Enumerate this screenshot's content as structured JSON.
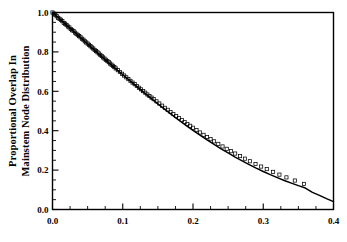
{
  "chart_data": {
    "type": "scatter",
    "title": "",
    "subtitle": "",
    "xlabel": "",
    "ylabel_line1": "Proportional Overlap In",
    "ylabel_line2": "Mainstem Node Distribution",
    "xlim": [
      0.0,
      0.4
    ],
    "ylim": [
      0.0,
      1.0
    ],
    "grid": false,
    "legend": null,
    "legend_position": "none",
    "x_ticks": [
      0.0,
      0.1,
      0.2,
      0.3,
      0.4
    ],
    "x_tick_labels": [
      "0.0",
      "0.1",
      "0.2",
      "0.3",
      "0.4"
    ],
    "x_minor_tick_step": 0.025,
    "y_ticks": [
      0.0,
      0.2,
      0.4,
      0.6,
      0.8,
      1.0
    ],
    "y_tick_labels": [
      "0.0",
      "0.2",
      "0.4",
      "0.6",
      "0.8",
      "1.0"
    ],
    "y_minor_tick_step": 0.05,
    "series": [
      {
        "name": "fitted curve",
        "type": "line",
        "marker": "none",
        "color": "#000000",
        "x": [
          0.0,
          0.01,
          0.02,
          0.03,
          0.04,
          0.05,
          0.06,
          0.07,
          0.08,
          0.09,
          0.1,
          0.11,
          0.12,
          0.13,
          0.14,
          0.15,
          0.16,
          0.17,
          0.18,
          0.19,
          0.2,
          0.21,
          0.22,
          0.23,
          0.24,
          0.25,
          0.26,
          0.27,
          0.28,
          0.29,
          0.3,
          0.31,
          0.32,
          0.33,
          0.34,
          0.35,
          0.36,
          0.37,
          0.38,
          0.39,
          0.4
        ],
        "y": [
          1.0,
          0.968,
          0.936,
          0.904,
          0.872,
          0.84,
          0.808,
          0.776,
          0.745,
          0.714,
          0.684,
          0.654,
          0.624,
          0.594,
          0.565,
          0.536,
          0.508,
          0.48,
          0.453,
          0.427,
          0.402,
          0.377,
          0.353,
          0.33,
          0.308,
          0.287,
          0.266,
          0.247,
          0.228,
          0.21,
          0.193,
          0.177,
          0.162,
          0.147,
          0.134,
          0.121,
          0.109,
          0.087,
          0.072,
          0.055,
          0.04
        ]
      },
      {
        "name": "observed data",
        "type": "scatter",
        "marker": "open-square",
        "color": "#000000",
        "x": [
          0.0,
          0.002,
          0.004,
          0.006,
          0.008,
          0.01,
          0.012,
          0.014,
          0.016,
          0.018,
          0.02,
          0.022,
          0.024,
          0.026,
          0.028,
          0.03,
          0.032,
          0.034,
          0.036,
          0.038,
          0.04,
          0.042,
          0.044,
          0.046,
          0.048,
          0.05,
          0.052,
          0.054,
          0.056,
          0.058,
          0.06,
          0.062,
          0.064,
          0.066,
          0.068,
          0.07,
          0.072,
          0.074,
          0.076,
          0.078,
          0.08,
          0.082,
          0.084,
          0.086,
          0.088,
          0.09,
          0.093,
          0.096,
          0.099,
          0.102,
          0.105,
          0.108,
          0.111,
          0.114,
          0.117,
          0.12,
          0.123,
          0.126,
          0.129,
          0.132,
          0.135,
          0.138,
          0.141,
          0.144,
          0.148,
          0.152,
          0.156,
          0.16,
          0.164,
          0.168,
          0.172,
          0.176,
          0.18,
          0.184,
          0.188,
          0.192,
          0.196,
          0.2,
          0.205,
          0.21,
          0.215,
          0.22,
          0.225,
          0.23,
          0.236,
          0.242,
          0.248,
          0.254,
          0.26,
          0.267,
          0.274,
          0.281,
          0.289,
          0.297,
          0.305,
          0.314,
          0.323,
          0.333,
          0.345,
          0.358
        ],
        "y": [
          1.0,
          0.994,
          0.988,
          0.981,
          0.973,
          0.968,
          0.963,
          0.956,
          0.947,
          0.943,
          0.936,
          0.929,
          0.924,
          0.916,
          0.91,
          0.906,
          0.898,
          0.892,
          0.886,
          0.88,
          0.874,
          0.867,
          0.862,
          0.854,
          0.848,
          0.842,
          0.836,
          0.829,
          0.823,
          0.817,
          0.81,
          0.804,
          0.798,
          0.792,
          0.785,
          0.779,
          0.772,
          0.766,
          0.76,
          0.754,
          0.748,
          0.741,
          0.735,
          0.729,
          0.723,
          0.716,
          0.707,
          0.698,
          0.689,
          0.68,
          0.671,
          0.662,
          0.653,
          0.644,
          0.636,
          0.627,
          0.618,
          0.61,
          0.601,
          0.593,
          0.584,
          0.576,
          0.568,
          0.56,
          0.549,
          0.538,
          0.527,
          0.516,
          0.506,
          0.495,
          0.485,
          0.474,
          0.464,
          0.454,
          0.444,
          0.434,
          0.425,
          0.415,
          0.403,
          0.391,
          0.379,
          0.368,
          0.357,
          0.346,
          0.333,
          0.32,
          0.308,
          0.296,
          0.284,
          0.271,
          0.258,
          0.245,
          0.231,
          0.218,
          0.205,
          0.191,
          0.177,
          0.163,
          0.147,
          0.13
        ]
      }
    ]
  }
}
